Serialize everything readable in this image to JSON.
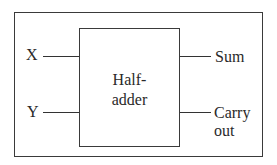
{
  "diagram": {
    "block_label_line1": "Half-",
    "block_label_line2": "adder",
    "inputs": [
      {
        "label": "X"
      },
      {
        "label": "Y"
      }
    ],
    "outputs": [
      {
        "label": "Sum"
      },
      {
        "label_line1": "Carry",
        "label_line2": "out"
      }
    ],
    "colors": {
      "stroke": "#333333",
      "text": "#2a2a2a",
      "background": "#ffffff"
    }
  }
}
